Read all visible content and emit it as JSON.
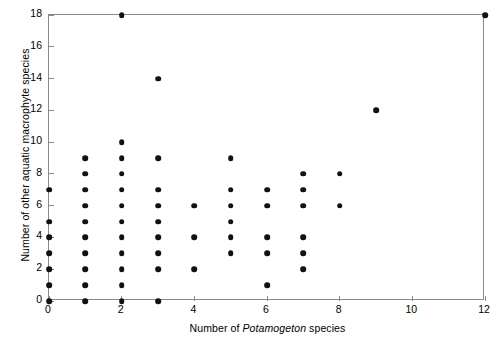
{
  "chart_data": {
    "type": "scatter",
    "title": "",
    "xlabel": "Number of Potamogeton species",
    "xlabel_parts": [
      {
        "text": "Number of ",
        "italic": false
      },
      {
        "text": "Potamogeton",
        "italic": true
      },
      {
        "text": " species",
        "italic": false
      }
    ],
    "ylabel": "Number of other aquatic macrophyte species",
    "xlim": [
      0,
      12
    ],
    "ylim": [
      0,
      18
    ],
    "xticks": [
      0,
      2,
      4,
      6,
      8,
      10,
      12
    ],
    "yticks": [
      0,
      2,
      4,
      6,
      8,
      10,
      12,
      14,
      16,
      18
    ],
    "xtick_labels": [
      "0",
      "2",
      "4",
      "6",
      "8",
      "10",
      "12"
    ],
    "ytick_labels": [
      "0",
      "2",
      "4",
      "6",
      "8",
      "10",
      "12",
      "14",
      "16",
      "18"
    ],
    "grid": false,
    "legend": null,
    "marker": "filled-circle",
    "marker_color": "#111111",
    "frame_color": "#8a8a8a",
    "background": "#ffffff",
    "x": [
      0,
      0,
      0,
      0,
      0,
      0,
      0,
      1,
      1,
      1,
      1,
      1,
      1,
      1,
      1,
      1,
      1,
      2,
      2,
      2,
      2,
      2,
      2,
      2,
      2,
      2,
      2,
      2,
      2,
      3,
      3,
      3,
      3,
      3,
      3,
      3,
      3,
      3,
      4,
      4,
      4,
      5,
      5,
      5,
      5,
      5,
      5,
      6,
      6,
      6,
      6,
      6,
      7,
      7,
      7,
      7,
      7,
      7,
      8,
      8,
      9,
      12
    ],
    "y": [
      0,
      1,
      2,
      3,
      4,
      5,
      7,
      0,
      1,
      2,
      3,
      4,
      5,
      6,
      7,
      8,
      9,
      0,
      1,
      2,
      3,
      4,
      5,
      6,
      7,
      8,
      9,
      10,
      18,
      0,
      2,
      3,
      4,
      5,
      6,
      7,
      9,
      14,
      2,
      4,
      6,
      3,
      4,
      5,
      6,
      7,
      9,
      1,
      3,
      4,
      6,
      7,
      2,
      3,
      4,
      6,
      7,
      8,
      6,
      8,
      12,
      18
    ],
    "n_points": 61,
    "points_by_column": {
      "0": [
        0,
        1,
        2,
        3,
        4,
        5,
        7
      ],
      "1": [
        0,
        1,
        2,
        3,
        4,
        5,
        6,
        7,
        8,
        9
      ],
      "2": [
        0,
        1,
        2,
        3,
        4,
        5,
        6,
        7,
        8,
        9,
        10,
        18
      ],
      "3": [
        0,
        2,
        3,
        4,
        5,
        6,
        7,
        9,
        14
      ],
      "4": [
        2,
        4,
        6
      ],
      "5": [
        3,
        4,
        5,
        6,
        7,
        9
      ],
      "6": [
        1,
        3,
        4,
        6,
        7
      ],
      "7": [
        2,
        3,
        4,
        6,
        7,
        8
      ],
      "8": [
        6,
        8
      ],
      "9": [
        12
      ],
      "12": [
        18
      ]
    }
  }
}
